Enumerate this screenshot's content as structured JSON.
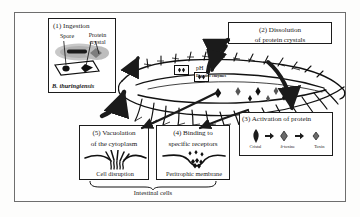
{
  "figure": {
    "background": "#fdfdfc",
    "ink": "#1a1a1a"
  },
  "steps": [
    {
      "id": "step-1",
      "number": "(1)",
      "title": "(1) Ingestion",
      "labels": {
        "spore": "Spore",
        "crystal": "Protein\ncrystal",
        "crystal_line1": "Protein",
        "crystal_line2": "crystal",
        "species": "B. thuringiensis"
      }
    },
    {
      "id": "step-2",
      "number": "(2)",
      "line1": "(2) Dissolution",
      "line2": "of protein crystals"
    },
    {
      "id": "step-3",
      "number": "(3)",
      "title": "(3) Activation of protein",
      "legend": [
        {
          "name": "crystal-symbol",
          "label": "Cristal"
        },
        {
          "name": "delta-toxin-symbol",
          "label": "δ-toxine"
        },
        {
          "name": "toxin-symbol",
          "label": "Toxin"
        }
      ]
    },
    {
      "id": "step-4",
      "number": "(4)",
      "line1": "(4) Binding to",
      "line2": "specific receptors",
      "sublabel": "Peritrophic membrane"
    },
    {
      "id": "step-5",
      "number": "(5)",
      "line1": "(5) Vacuolation",
      "line2": "of the cytoplasm",
      "sublabel": "Cell disruption"
    }
  ],
  "gut": {
    "ph_label": "pH",
    "enzymes_label": "Digestive enzymes"
  },
  "bottom": {
    "intestinal_label": "Intestinal cells"
  }
}
